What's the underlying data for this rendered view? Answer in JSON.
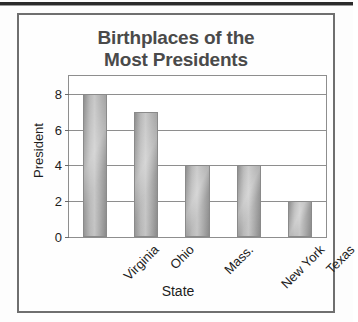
{
  "page": {
    "top_rule": "scanned-page-rule"
  },
  "figure": {
    "frame_color": "#6f6f6f",
    "background": "#fefefe"
  },
  "chart_data": {
    "type": "bar",
    "title": "Birthplaces of the Most Presidents",
    "title_lines": [
      "Birthplaces of the",
      "Most Presidents"
    ],
    "xlabel": "State",
    "ylabel": "President",
    "categories": [
      "Virginia",
      "Ohio",
      "Mass.",
      "New York",
      "Texas"
    ],
    "values": [
      8,
      7,
      4,
      4,
      2
    ],
    "ylim": [
      0,
      9
    ],
    "yticks": [
      0,
      2,
      4,
      6,
      8
    ],
    "ytick_labels": [
      "0",
      "2",
      "4",
      "6",
      "8"
    ],
    "grid": true,
    "grid_orientation": "horizontal",
    "legend": null,
    "bar_fill": "#b3b3b3",
    "bar_edge": "#8a8a8a",
    "axis_color": "#8e8e8e",
    "text_color": "#1d1d1d",
    "title_color": "#4a4a4a",
    "xtick_rotation": -45
  }
}
